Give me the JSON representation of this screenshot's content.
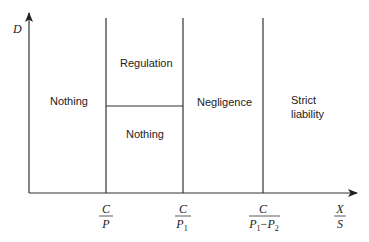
{
  "diagram": {
    "type": "region-diagram",
    "axes": {
      "y_label": "D",
      "x_label": {
        "numerator": "X",
        "denominator": "S"
      }
    },
    "x_ticks": [
      {
        "numerator": "C",
        "denominator": "P"
      },
      {
        "numerator": "C",
        "denominator": "P1",
        "den_base": "P",
        "den_sub": "1"
      },
      {
        "numerator": "C",
        "denominator": "P1 − P2",
        "den_base1": "P",
        "den_sub1": "1",
        "den_op": "−",
        "den_base2": "P",
        "den_sub2": "2"
      }
    ],
    "regions": {
      "left": "Nothing",
      "middle_top": "Regulation",
      "middle_bottom": "Nothing",
      "third": "Negligence",
      "right_line1": "Strict",
      "right_line2": "liability"
    }
  }
}
